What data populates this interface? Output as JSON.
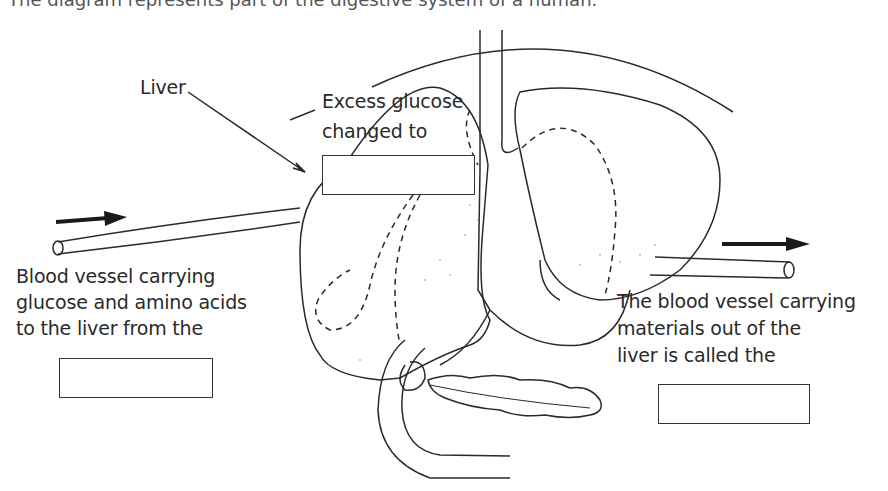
{
  "caption": "The diagram represents part of the digestive system of a human.",
  "labels": {
    "liver": "Liver",
    "excess_glucose": [
      "Excess glucose",
      "changed to"
    ],
    "blood_in": [
      "Blood vessel carrying",
      "glucose and amino acids",
      "to the liver from the"
    ],
    "blood_out": [
      "The blood vessel carrying",
      "materials out of the",
      "liver is called the"
    ]
  },
  "answer_boxes": [
    {
      "id": "excess-glucose-answer",
      "value": ""
    },
    {
      "id": "blood-in-answer",
      "value": ""
    },
    {
      "id": "blood-out-answer",
      "value": ""
    }
  ],
  "colors": {
    "line": "#2a2a2a",
    "arrow": "#1a1a1a"
  }
}
